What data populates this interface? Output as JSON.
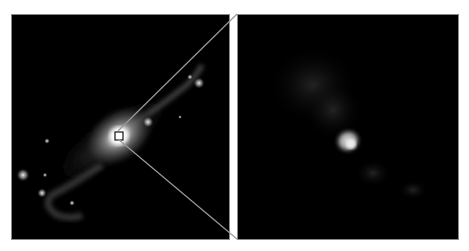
{
  "figure": {
    "type": "astronomical image comparison",
    "left_panel": {
      "label": "wide-field galaxy view",
      "inset_box": {
        "x": 118,
        "y": 135,
        "size": 8
      }
    },
    "right_panel": {
      "label": "zoomed nucleus region"
    },
    "colors": {
      "background": "#ffffff",
      "panel_bg": "#000000",
      "connector_line": "#9a9a9a",
      "border": "#8a8a8a"
    }
  }
}
